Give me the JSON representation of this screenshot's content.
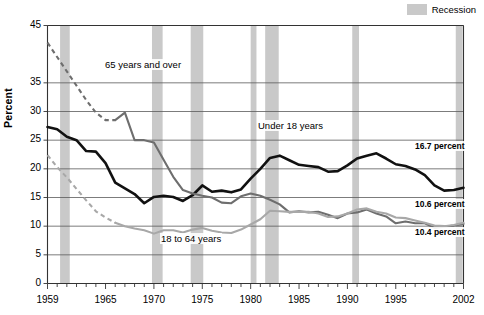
{
  "legend": {
    "recession_label": "Recession",
    "recession_color": "#c9c9c9"
  },
  "axes": {
    "ylabel": "Percent",
    "ytick_labels": [
      "0",
      "5",
      "10",
      "15",
      "20",
      "25",
      "30",
      "35",
      "45"
    ],
    "xtick_labels": [
      "1959",
      "1965",
      "1970",
      "1975",
      "1980",
      "1985",
      "1990",
      "1995",
      "2002"
    ]
  },
  "annotations": {
    "under18": "Under 18 years",
    "over65": "65 years and over",
    "adults": "18 to 64 years",
    "end_under18": "16.7 percent",
    "end_adults": "10.6 percent",
    "end_over65": "10.4 percent"
  },
  "chart_data": {
    "type": "line",
    "title": "",
    "xlabel": "",
    "ylabel": "Percent",
    "xlim": [
      1959,
      2002
    ],
    "ylim": [
      0,
      45
    ],
    "yticks": [
      0,
      5,
      10,
      15,
      20,
      25,
      30,
      35,
      45
    ],
    "xticks": [
      1959,
      1965,
      1970,
      1975,
      1980,
      1985,
      1990,
      1995,
      2002
    ],
    "grid": "horizontal",
    "legend_position": "top-right",
    "colors": {
      "under18": "#111111",
      "over65": "#6e6e6e",
      "adults": "#a8a8a8"
    },
    "shaded_regions": {
      "label": "Recession",
      "color": "#c9c9c9",
      "spans": [
        [
          1960.3,
          1961.3
        ],
        [
          1969.8,
          1970.9
        ],
        [
          1973.8,
          1975.1
        ],
        [
          1980.0,
          1980.6
        ],
        [
          1981.5,
          1982.9
        ],
        [
          1990.5,
          1991.2
        ],
        [
          2001.2,
          2001.9
        ]
      ]
    },
    "series": [
      {
        "name": "Under 18 years",
        "color": "#111111",
        "style": "solid",
        "end_value": 16.7,
        "x": [
          1959,
          1960,
          1961,
          1962,
          1963,
          1964,
          1965,
          1966,
          1967,
          1968,
          1969,
          1970,
          1971,
          1972,
          1973,
          1974,
          1975,
          1976,
          1977,
          1978,
          1979,
          1980,
          1981,
          1982,
          1983,
          1984,
          1985,
          1986,
          1987,
          1988,
          1989,
          1990,
          1991,
          1992,
          1993,
          1994,
          1995,
          1996,
          1997,
          1998,
          1999,
          2000,
          2001,
          2002
        ],
        "values": [
          27.3,
          26.9,
          25.6,
          25.0,
          23.1,
          23.0,
          21.0,
          17.6,
          16.6,
          15.6,
          14.0,
          15.1,
          15.3,
          15.1,
          14.4,
          15.4,
          17.1,
          16.0,
          16.2,
          15.9,
          16.4,
          18.3,
          20.0,
          21.9,
          22.3,
          21.5,
          20.7,
          20.5,
          20.3,
          19.5,
          19.6,
          20.6,
          21.8,
          22.3,
          22.7,
          21.8,
          20.8,
          20.5,
          19.9,
          18.9,
          17.1,
          16.2,
          16.3,
          16.7
        ]
      },
      {
        "name": "65 years and over",
        "color": "#6e6e6e",
        "style": "dashed-then-solid",
        "dash_until": 1966,
        "end_value": 10.4,
        "x": [
          1959,
          1960,
          1961,
          1962,
          1963,
          1964,
          1965,
          1966,
          1967,
          1968,
          1969,
          1970,
          1971,
          1972,
          1973,
          1974,
          1975,
          1976,
          1977,
          1978,
          1979,
          1980,
          1981,
          1982,
          1983,
          1984,
          1985,
          1986,
          1987,
          1988,
          1989,
          1990,
          1991,
          1992,
          1993,
          1994,
          1995,
          1996,
          1997,
          1998,
          1999,
          2000,
          2001,
          2002
        ],
        "values": [
          42.0,
          39.5,
          37.0,
          34.5,
          32.0,
          29.8,
          28.5,
          28.5,
          29.8,
          25.0,
          25.0,
          24.6,
          21.6,
          18.6,
          16.3,
          15.7,
          15.3,
          15.0,
          14.1,
          14.0,
          15.2,
          15.7,
          15.3,
          14.6,
          13.8,
          12.4,
          12.6,
          12.4,
          12.5,
          12.0,
          11.4,
          12.2,
          12.4,
          12.9,
          12.2,
          11.7,
          10.5,
          10.8,
          10.5,
          10.5,
          9.7,
          9.9,
          10.1,
          10.4
        ]
      },
      {
        "name": "18 to 64 years",
        "color": "#a8a8a8",
        "style": "dashed-then-solid",
        "dash_until": 1966,
        "end_value": 10.6,
        "x": [
          1959,
          1960,
          1961,
          1962,
          1963,
          1964,
          1965,
          1966,
          1967,
          1968,
          1969,
          1970,
          1971,
          1972,
          1973,
          1974,
          1975,
          1976,
          1977,
          1978,
          1979,
          1980,
          1981,
          1982,
          1983,
          1984,
          1985,
          1986,
          1987,
          1988,
          1989,
          1990,
          1991,
          1992,
          1993,
          1994,
          1995,
          1996,
          1997,
          1998,
          1999,
          2000,
          2001,
          2002
        ],
        "values": [
          22.4,
          20.3,
          18.5,
          16.5,
          14.5,
          12.6,
          11.5,
          10.6,
          10.0,
          9.6,
          9.3,
          8.7,
          9.3,
          9.3,
          8.9,
          9.4,
          9.7,
          9.2,
          8.9,
          8.8,
          9.4,
          10.3,
          11.2,
          12.7,
          12.6,
          12.5,
          12.5,
          12.5,
          12.2,
          11.6,
          11.7,
          12.2,
          12.9,
          13.1,
          12.5,
          12.2,
          11.5,
          11.4,
          11.0,
          10.6,
          10.1,
          10.0,
          10.2,
          10.6
        ]
      }
    ]
  }
}
